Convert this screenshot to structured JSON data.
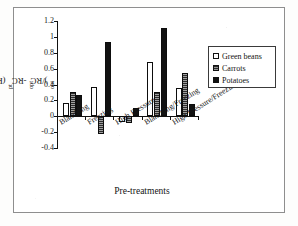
{
  "figure": {
    "x_axis_title": "Pre-treatments",
    "y_axis_title_plain": "(RCpt-RCopt)/RCopt",
    "y_axis_title_parts": {
      "open_paren": "(RC",
      "sub1": "pt",
      "minus": "-RC",
      "sub2": "opt",
      "close": ")/RC",
      "sub3": "opt"
    }
  },
  "legend": {
    "position": "right",
    "items": [
      {
        "label": "Green beans",
        "swatch": "open-white-square",
        "color": "#ffffff"
      },
      {
        "label": "Carrots",
        "swatch": "dark-hatched-square",
        "color": "#2b2b2b"
      },
      {
        "label": "Potatoes",
        "swatch": "solid-black-square",
        "color": "#111111"
      }
    ]
  },
  "axes": {
    "y_ticks": [
      "1.2",
      "1",
      "0.8",
      "0.6",
      "0.4",
      "0.2",
      "0",
      "-0.2",
      "-0.4"
    ],
    "y_tick_values": [
      1.2,
      1.0,
      0.8,
      0.6,
      0.4,
      0.2,
      0.0,
      -0.2,
      -0.4
    ],
    "y_min": -0.4,
    "y_max": 1.2,
    "y_step": 0.2
  },
  "chart_data": {
    "type": "bar",
    "title": "",
    "subtitle": "",
    "xlabel": "Pre-treatments",
    "ylabel": "(RCpt-RCopt)/RCopt",
    "ylim": [
      -0.4,
      1.2
    ],
    "ystep": 0.2,
    "grid": false,
    "legend_position": "right",
    "categories": [
      "Blanching",
      "Freezing",
      "High Pressure",
      "Blanching/Freezing",
      "High Pressure/Freezing"
    ],
    "series": [
      {
        "name": "Green beans",
        "color": "#ffffff",
        "values": [
          0.17,
          0.37,
          -0.07,
          0.68,
          0.36
        ]
      },
      {
        "name": "Carrots",
        "color": "#2b2b2b",
        "values": [
          0.31,
          -0.22,
          -0.08,
          0.31,
          0.55
        ]
      },
      {
        "name": "Potatoes",
        "color": "#111111",
        "values": [
          0.27,
          0.94,
          0.11,
          1.11,
          0.16
        ]
      }
    ]
  }
}
